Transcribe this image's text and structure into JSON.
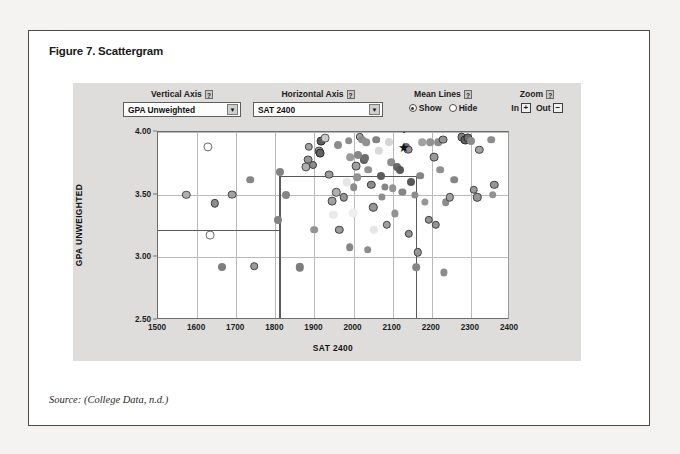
{
  "figure": {
    "title": "Figure 7. Scattergram",
    "source": "Source: (College Data, n.d.)"
  },
  "controls": {
    "vertical_axis": {
      "label": "Vertical Axis",
      "help": "?",
      "value": "GPA Unweighted",
      "arrow": "▼"
    },
    "horizontal_axis": {
      "label": "Horizontal Axis",
      "help": "?",
      "value": "SAT 2400",
      "arrow": "▼"
    },
    "mean_lines": {
      "label": "Mean Lines",
      "help": "?",
      "options": [
        "Show",
        "Hide"
      ],
      "selected": "Show"
    },
    "zoom": {
      "label": "Zoom",
      "help": "?",
      "in_label": "In",
      "in_glyph": "+",
      "out_label": "Out",
      "out_glyph": "−"
    }
  },
  "annotation": {
    "you_are_here": "YOU ARE HERE",
    "arrow": "⬇",
    "star": "★",
    "star_point": {
      "x": 2128,
      "y": 3.88
    }
  },
  "chart_data": {
    "type": "scatter",
    "title": "Scattergram",
    "xlabel": "SAT 2400",
    "ylabel": "GPA UNWEIGHTED",
    "xlim": [
      1500,
      2400
    ],
    "ylim": [
      2.5,
      4.0
    ],
    "xticks": [
      1500,
      1600,
      1700,
      1800,
      1900,
      2000,
      2100,
      2200,
      2300,
      2400
    ],
    "yticks": [
      2.5,
      3.0,
      3.5,
      4.0
    ],
    "ytick_labels": [
      "2.50",
      "3.00",
      "3.50",
      "4.00"
    ],
    "grid": true,
    "legend": "none",
    "mean_lines": {
      "show": true,
      "segments": [
        {
          "orient": "h",
          "y": 3.65,
          "x_from": 1810,
          "x_to": 2160
        },
        {
          "orient": "v",
          "x": 2160,
          "y_from": 2.5,
          "y_to": 3.65
        },
        {
          "orient": "h",
          "y": 3.22,
          "x_from": 1500,
          "x_to": 1810
        },
        {
          "orient": "v",
          "x": 1810,
          "y_from": 3.22,
          "y_to": 3.65
        },
        {
          "orient": "v",
          "x": 1810,
          "y_from": 2.5,
          "y_to": 3.22
        }
      ]
    },
    "points": [
      {
        "x": 1572,
        "y": 3.5,
        "tone": 0.62,
        "ring": true,
        "r": 4.2
      },
      {
        "x": 1628,
        "y": 3.88,
        "tone": 0.99,
        "ring": true,
        "r": 4.6
      },
      {
        "x": 1633,
        "y": 3.18,
        "tone": 0.97,
        "ring": true,
        "r": 4.4
      },
      {
        "x": 1646,
        "y": 3.43,
        "tone": 0.45,
        "ring": true,
        "r": 4.2
      },
      {
        "x": 1664,
        "y": 2.92,
        "tone": 0.38,
        "ring": false,
        "r": 4.0
      },
      {
        "x": 1690,
        "y": 3.5,
        "tone": 0.55,
        "ring": true,
        "r": 4.4
      },
      {
        "x": 1735,
        "y": 3.62,
        "tone": 0.42,
        "ring": false,
        "r": 3.8
      },
      {
        "x": 1746,
        "y": 2.93,
        "tone": 0.52,
        "ring": true,
        "r": 3.8
      },
      {
        "x": 1806,
        "y": 3.3,
        "tone": 0.4,
        "ring": false,
        "r": 4.0
      },
      {
        "x": 1812,
        "y": 3.68,
        "tone": 0.4,
        "ring": false,
        "r": 4.0
      },
      {
        "x": 1826,
        "y": 3.5,
        "tone": 0.42,
        "ring": false,
        "r": 4.0
      },
      {
        "x": 1862,
        "y": 2.92,
        "tone": 0.38,
        "ring": false,
        "r": 4.2
      },
      {
        "x": 1878,
        "y": 3.72,
        "tone": 0.62,
        "ring": true,
        "r": 4.6
      },
      {
        "x": 1884,
        "y": 3.78,
        "tone": 0.5,
        "ring": true,
        "r": 4.4
      },
      {
        "x": 1885,
        "y": 3.88,
        "tone": 0.55,
        "ring": true,
        "r": 4.2
      },
      {
        "x": 1896,
        "y": 3.74,
        "tone": 0.45,
        "ring": true,
        "r": 4.0
      },
      {
        "x": 1900,
        "y": 3.22,
        "tone": 0.48,
        "ring": false,
        "r": 3.8
      },
      {
        "x": 1912,
        "y": 3.85,
        "tone": 0.58,
        "ring": true,
        "r": 4.4
      },
      {
        "x": 1914,
        "y": 3.83,
        "tone": 0.25,
        "ring": true,
        "r": 4.4
      },
      {
        "x": 1918,
        "y": 3.93,
        "tone": 0.22,
        "ring": true,
        "r": 4.4
      },
      {
        "x": 1928,
        "y": 3.95,
        "tone": 0.75,
        "ring": true,
        "r": 4.4
      },
      {
        "x": 1938,
        "y": 3.66,
        "tone": 0.52,
        "ring": true,
        "r": 4.4
      },
      {
        "x": 1946,
        "y": 3.45,
        "tone": 0.55,
        "ring": true,
        "r": 4.4
      },
      {
        "x": 1956,
        "y": 3.52,
        "tone": 0.62,
        "ring": true,
        "r": 4.2
      },
      {
        "x": 1960,
        "y": 3.9,
        "tone": 0.45,
        "ring": false,
        "r": 4.0
      },
      {
        "x": 1964,
        "y": 3.22,
        "tone": 0.52,
        "ring": true,
        "r": 4.2
      },
      {
        "x": 1975,
        "y": 3.48,
        "tone": 0.5,
        "ring": true,
        "r": 4.2
      },
      {
        "x": 1982,
        "y": 3.6,
        "tone": 0.88,
        "ring": false,
        "r": 4.2
      },
      {
        "x": 1988,
        "y": 3.93,
        "tone": 0.45,
        "ring": false,
        "r": 3.8
      },
      {
        "x": 1992,
        "y": 3.8,
        "tone": 0.52,
        "ring": false,
        "r": 3.8
      },
      {
        "x": 1998,
        "y": 3.35,
        "tone": 0.92,
        "ring": false,
        "r": 4.4
      },
      {
        "x": 2000,
        "y": 3.56,
        "tone": 0.45,
        "ring": false,
        "r": 3.8
      },
      {
        "x": 2006,
        "y": 3.73,
        "tone": 0.55,
        "ring": true,
        "r": 4.4
      },
      {
        "x": 2010,
        "y": 3.64,
        "tone": 0.48,
        "ring": false,
        "r": 3.8
      },
      {
        "x": 2012,
        "y": 3.82,
        "tone": 0.42,
        "ring": false,
        "r": 4.0
      },
      {
        "x": 2016,
        "y": 3.96,
        "tone": 0.55,
        "ring": true,
        "r": 4.2
      },
      {
        "x": 2022,
        "y": 3.94,
        "tone": 0.45,
        "ring": false,
        "r": 3.8
      },
      {
        "x": 2026,
        "y": 3.78,
        "tone": 0.22,
        "ring": false,
        "r": 4.0
      },
      {
        "x": 2030,
        "y": 3.79,
        "tone": 0.3,
        "ring": false,
        "r": 4.0
      },
      {
        "x": 2032,
        "y": 3.92,
        "tone": 0.48,
        "ring": false,
        "r": 3.8
      },
      {
        "x": 2038,
        "y": 3.7,
        "tone": 0.48,
        "ring": false,
        "r": 3.8
      },
      {
        "x": 2045,
        "y": 3.58,
        "tone": 0.45,
        "ring": true,
        "r": 4.2
      },
      {
        "x": 2050,
        "y": 3.4,
        "tone": 0.5,
        "ring": true,
        "r": 4.2
      },
      {
        "x": 2052,
        "y": 3.22,
        "tone": 0.88,
        "ring": false,
        "r": 4.2
      },
      {
        "x": 2058,
        "y": 3.94,
        "tone": 0.4,
        "ring": false,
        "r": 3.8
      },
      {
        "x": 2064,
        "y": 3.85,
        "tone": 0.82,
        "ring": false,
        "r": 4.2
      },
      {
        "x": 2070,
        "y": 3.65,
        "tone": 0.22,
        "ring": false,
        "r": 4.0
      },
      {
        "x": 2072,
        "y": 3.48,
        "tone": 0.45,
        "ring": false,
        "r": 3.6
      },
      {
        "x": 2080,
        "y": 3.56,
        "tone": 0.42,
        "ring": false,
        "r": 3.6
      },
      {
        "x": 2085,
        "y": 3.26,
        "tone": 0.55,
        "ring": true,
        "r": 4.2
      },
      {
        "x": 2090,
        "y": 3.92,
        "tone": 0.8,
        "ring": false,
        "r": 4.0
      },
      {
        "x": 2096,
        "y": 3.76,
        "tone": 0.45,
        "ring": false,
        "r": 3.8
      },
      {
        "x": 2100,
        "y": 3.55,
        "tone": 0.48,
        "ring": false,
        "r": 3.8
      },
      {
        "x": 2106,
        "y": 3.35,
        "tone": 0.48,
        "ring": false,
        "r": 3.6
      },
      {
        "x": 2112,
        "y": 3.72,
        "tone": 0.28,
        "ring": false,
        "r": 4.0
      },
      {
        "x": 2118,
        "y": 3.7,
        "tone": 0.2,
        "ring": false,
        "r": 4.0
      },
      {
        "x": 2125,
        "y": 3.52,
        "tone": 0.42,
        "ring": false,
        "r": 3.6
      },
      {
        "x": 2134,
        "y": 3.88,
        "tone": 0.3,
        "ring": false,
        "r": 4.0
      },
      {
        "x": 2140,
        "y": 3.86,
        "tone": 0.48,
        "ring": true,
        "r": 4.4
      },
      {
        "x": 2142,
        "y": 3.19,
        "tone": 0.48,
        "ring": true,
        "r": 4.2
      },
      {
        "x": 2148,
        "y": 3.6,
        "tone": 0.2,
        "ring": false,
        "r": 4.0
      },
      {
        "x": 2156,
        "y": 3.5,
        "tone": 0.45,
        "ring": false,
        "r": 3.6
      },
      {
        "x": 2160,
        "y": 2.92,
        "tone": 0.42,
        "ring": false,
        "r": 3.8
      },
      {
        "x": 2164,
        "y": 3.04,
        "tone": 0.5,
        "ring": true,
        "r": 4.2
      },
      {
        "x": 2170,
        "y": 3.65,
        "tone": 0.42,
        "ring": false,
        "r": 3.8
      },
      {
        "x": 2176,
        "y": 3.92,
        "tone": 0.55,
        "ring": false,
        "r": 3.8
      },
      {
        "x": 2182,
        "y": 3.44,
        "tone": 0.5,
        "ring": false,
        "r": 3.6
      },
      {
        "x": 2192,
        "y": 3.3,
        "tone": 0.48,
        "ring": true,
        "r": 4.2
      },
      {
        "x": 2196,
        "y": 3.92,
        "tone": 0.48,
        "ring": false,
        "r": 3.8
      },
      {
        "x": 2206,
        "y": 3.8,
        "tone": 0.52,
        "ring": true,
        "r": 4.4
      },
      {
        "x": 2210,
        "y": 3.26,
        "tone": 0.5,
        "ring": true,
        "r": 4.2
      },
      {
        "x": 2216,
        "y": 3.92,
        "tone": 0.45,
        "ring": false,
        "r": 3.8
      },
      {
        "x": 2222,
        "y": 3.7,
        "tone": 0.48,
        "ring": false,
        "r": 3.8
      },
      {
        "x": 2228,
        "y": 3.94,
        "tone": 0.5,
        "ring": true,
        "r": 4.4
      },
      {
        "x": 2236,
        "y": 3.44,
        "tone": 0.45,
        "ring": false,
        "r": 3.8
      },
      {
        "x": 2246,
        "y": 3.48,
        "tone": 0.55,
        "ring": true,
        "r": 4.2
      },
      {
        "x": 2258,
        "y": 3.62,
        "tone": 0.42,
        "ring": false,
        "r": 3.8
      },
      {
        "x": 2276,
        "y": 3.96,
        "tone": 0.4,
        "ring": true,
        "r": 4.4
      },
      {
        "x": 2286,
        "y": 3.94,
        "tone": 0.25,
        "ring": true,
        "r": 4.6
      },
      {
        "x": 2292,
        "y": 3.95,
        "tone": 0.3,
        "ring": true,
        "r": 4.6
      },
      {
        "x": 2300,
        "y": 3.93,
        "tone": 0.45,
        "ring": false,
        "r": 4.0
      },
      {
        "x": 2308,
        "y": 3.54,
        "tone": 0.52,
        "ring": true,
        "r": 4.2
      },
      {
        "x": 2316,
        "y": 3.48,
        "tone": 0.5,
        "ring": true,
        "r": 4.2
      },
      {
        "x": 2322,
        "y": 3.86,
        "tone": 0.55,
        "ring": true,
        "r": 4.2
      },
      {
        "x": 2352,
        "y": 3.94,
        "tone": 0.45,
        "ring": false,
        "r": 3.8
      },
      {
        "x": 2356,
        "y": 3.5,
        "tone": 0.48,
        "ring": false,
        "r": 3.8
      },
      {
        "x": 2360,
        "y": 3.58,
        "tone": 0.5,
        "ring": true,
        "r": 4.2
      },
      {
        "x": 1990,
        "y": 3.08,
        "tone": 0.42,
        "ring": false,
        "r": 3.8
      },
      {
        "x": 2036,
        "y": 3.06,
        "tone": 0.45,
        "ring": false,
        "r": 3.8
      },
      {
        "x": 2230,
        "y": 2.88,
        "tone": 0.45,
        "ring": false,
        "r": 3.6
      },
      {
        "x": 1948,
        "y": 3.34,
        "tone": 0.9,
        "ring": false,
        "r": 4.2
      }
    ]
  }
}
